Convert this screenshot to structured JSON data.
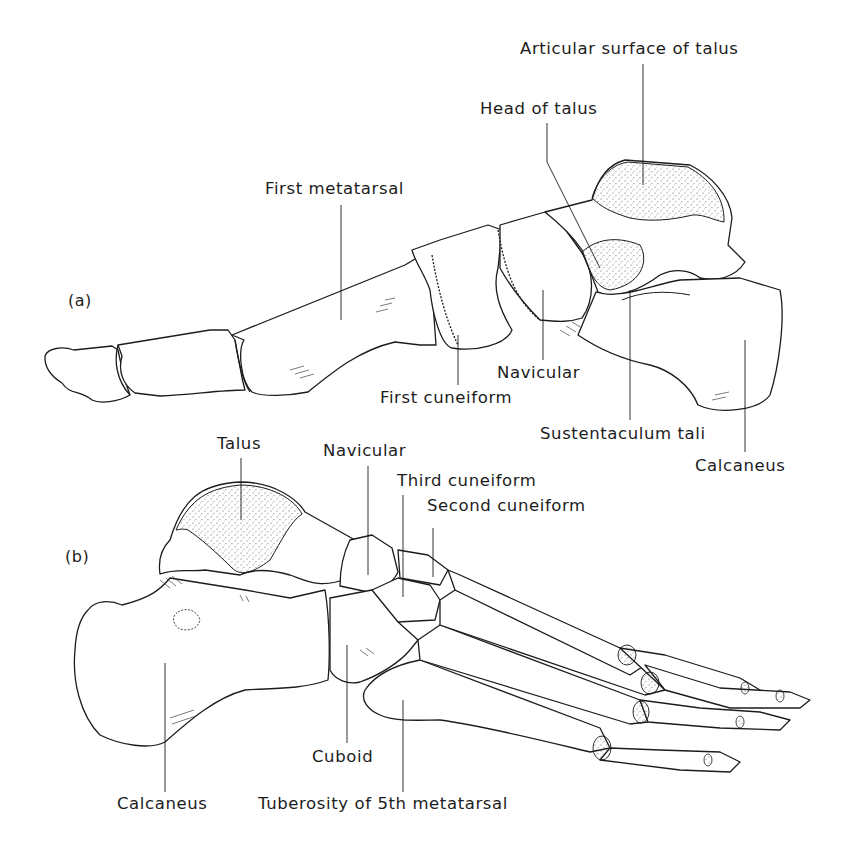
{
  "figure": {
    "panels": [
      {
        "id": "a",
        "tag": "(a)",
        "view": "medial view of foot skeleton",
        "labels": [
          {
            "text": "Articular surface of talus"
          },
          {
            "text": "Head of talus"
          },
          {
            "text": "First metatarsal"
          },
          {
            "text": "Navicular"
          },
          {
            "text": "First cuneiform"
          },
          {
            "text": "Sustentaculum tali"
          },
          {
            "text": "Calcaneus"
          }
        ]
      },
      {
        "id": "b",
        "tag": "(b)",
        "view": "lateral view of foot skeleton",
        "labels": [
          {
            "text": "Talus"
          },
          {
            "text": "Navicular"
          },
          {
            "text": "Third cuneiform"
          },
          {
            "text": "Second cuneiform"
          },
          {
            "text": "Cuboid"
          },
          {
            "text": "Calcaneus"
          },
          {
            "text": "Tuberosity of 5th metatarsal"
          }
        ]
      }
    ],
    "colors": {
      "ink": "#1c1c1c",
      "background": "#ffffff",
      "stipple": "#555555"
    }
  }
}
